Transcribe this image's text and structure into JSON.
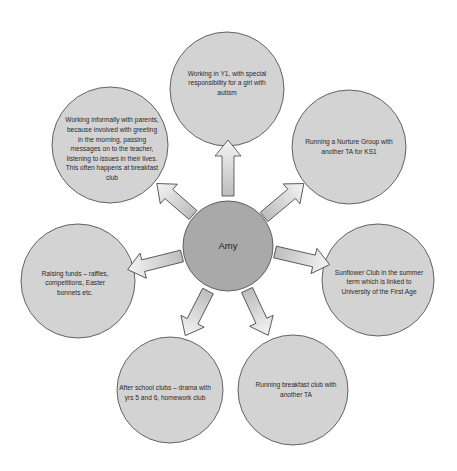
{
  "center": {
    "label": "Amy",
    "fill": "#a9a9a9"
  },
  "node_fill": "#d3d3d3",
  "stroke": "#555555",
  "nodes": [
    {
      "id": "top",
      "label": "Working in Y1, with special responsibility for a girl with autism"
    },
    {
      "id": "top-right",
      "label": "Running a Nurture Group with another TA for KS1"
    },
    {
      "id": "right",
      "label": "Sunflower Club in the summer term which is linked to University of the First Age"
    },
    {
      "id": "bottom-right",
      "label": "Running breakfast club with another TA"
    },
    {
      "id": "bottom-left",
      "label": "After school clubs – drama with yrs 5 and 6, homework club"
    },
    {
      "id": "left",
      "label": "Raising funds – raffles, competitions, Easter bonnets etc."
    },
    {
      "id": "top-left",
      "label": "Working informally with parents, because involved with greeting in the morning, passing messages on to the teacher, listening to issues in their lives. This often happens at breakfast club"
    }
  ]
}
